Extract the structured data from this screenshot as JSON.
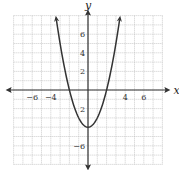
{
  "chart_data": {
    "type": "line",
    "title": "",
    "function": "y = x^2 - 4",
    "xlabel": "x",
    "ylabel": "y",
    "xlim": [
      -8,
      8
    ],
    "ylim": [
      -8,
      8
    ],
    "grid": true,
    "x_tick_labels": [
      "-6",
      "-4",
      "4",
      "6"
    ],
    "x_tick_values": [
      -6,
      -4,
      4,
      6
    ],
    "y_tick_labels": [
      "6",
      "4",
      "2",
      "2",
      "-6"
    ],
    "y_tick_values": [
      6,
      4,
      2,
      -2,
      -6
    ],
    "series": [
      {
        "name": "parabola",
        "x": [
          -3.4,
          -3,
          -2,
          -1,
          0,
          1,
          2,
          3,
          3.4
        ],
        "values": [
          7.56,
          5,
          0,
          -3,
          -4,
          -3,
          0,
          5,
          7.56
        ]
      }
    ],
    "key_points": {
      "vertex": [
        0,
        -4
      ],
      "x_intercepts": [
        [
          -2,
          0
        ],
        [
          2,
          0
        ]
      ],
      "y_intercept": [
        0,
        -4
      ]
    }
  },
  "colors": {
    "curve": "#333333",
    "axis": "#333333",
    "grid": "#b8b8b8",
    "background": "#ffffff"
  }
}
